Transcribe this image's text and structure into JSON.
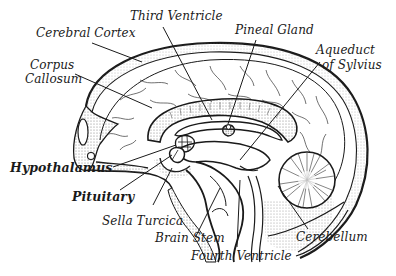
{
  "diagram": {
    "colors": {
      "ink": "#1a1a1a",
      "stipple": "#8a8a8a",
      "background": "#ffffff"
    },
    "labels": [
      {
        "id": "third-ventricle",
        "text": "Third Ventricle",
        "bold": false
      },
      {
        "id": "cerebral-cortex",
        "text": "Cerebral Cortex",
        "bold": false
      },
      {
        "id": "pineal-gland",
        "text": "Pineal Gland",
        "bold": false
      },
      {
        "id": "aqueduct-line1",
        "text": "Aqueduct",
        "bold": false
      },
      {
        "id": "aqueduct-line2",
        "text": "of Sylvius",
        "bold": false
      },
      {
        "id": "corpus-line1",
        "text": "Corpus",
        "bold": false
      },
      {
        "id": "corpus-line2",
        "text": "Callosum",
        "bold": false
      },
      {
        "id": "hypothalamus",
        "text": "Hypothalamus",
        "bold": true
      },
      {
        "id": "pituitary",
        "text": "Pituitary",
        "bold": true
      },
      {
        "id": "sella-turcica",
        "text": "Sella Turcica",
        "bold": false
      },
      {
        "id": "brain-stem",
        "text": "Brain Stem",
        "bold": false
      },
      {
        "id": "fourth-ventricle",
        "text": "Fourth Ventricle",
        "bold": false
      },
      {
        "id": "cerebellum",
        "text": "Cerebellum",
        "bold": false
      }
    ]
  }
}
